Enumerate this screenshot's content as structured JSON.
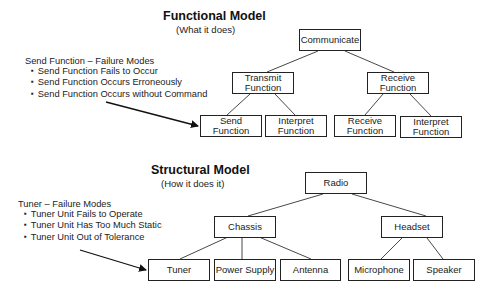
{
  "functional_model": {
    "title": "Functional Model",
    "subtitle": "(What it does)",
    "notes": {
      "heading": "Send Function – Failure Modes",
      "items": [
        "Send Function Fails to Occur",
        "Send Function Occurs Erroneously",
        "Send Function Occurs without Command"
      ]
    },
    "nodes": {
      "root": "Communicate",
      "transmit": "Transmit Function",
      "receive": "Receive Function",
      "send": "Send Function",
      "interpret_tx": "Interpret Function",
      "receive_leaf": "Receive Function",
      "interpret_rx": "Interpret Function"
    }
  },
  "structural_model": {
    "title": "Structural Model",
    "subtitle": "(How it does it)",
    "notes": {
      "heading": "Tuner – Failure Modes",
      "items": [
        "Tuner Unit Fails to Operate",
        "Tuner Unit Has Too Much Static",
        "Tuner Unit Out of Tolerance"
      ]
    },
    "nodes": {
      "root": "Radio",
      "chassis": "Chassis",
      "headset": "Headset",
      "tuner": "Tuner",
      "power_supply": "Power Supply",
      "antenna": "Antenna",
      "microphone": "Microphone",
      "speaker": "Speaker"
    }
  }
}
